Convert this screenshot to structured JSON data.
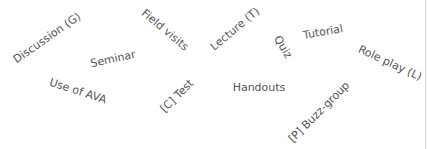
{
  "word_cloud": {
    "text_color": "#555555",
    "background": "#ffffff",
    "words": [
      {
        "text": "Discussion (G)",
        "x": 47,
        "y": 38,
        "rotate": -35,
        "size": 11
      },
      {
        "text": "Seminar",
        "x": 113,
        "y": 59,
        "rotate": -12,
        "size": 11
      },
      {
        "text": "Field visits",
        "x": 165,
        "y": 30,
        "rotate": 40,
        "size": 11
      },
      {
        "text": "Lecture (T)",
        "x": 235,
        "y": 29,
        "rotate": -40,
        "size": 11
      },
      {
        "text": "Quiz",
        "x": 283,
        "y": 47,
        "rotate": 60,
        "size": 11
      },
      {
        "text": "Tutorial",
        "x": 323,
        "y": 32,
        "rotate": -10,
        "size": 11
      },
      {
        "text": "Role play (L)",
        "x": 390,
        "y": 63,
        "rotate": 25,
        "size": 11
      },
      {
        "text": "Use of AVA",
        "x": 78,
        "y": 91,
        "rotate": 18,
        "size": 11
      },
      {
        "text": "[C] Test",
        "x": 177,
        "y": 96,
        "rotate": -45,
        "size": 11
      },
      {
        "text": "Handouts",
        "x": 259,
        "y": 87,
        "rotate": 0,
        "size": 11
      },
      {
        "text": "[P] Buzz-group",
        "x": 319,
        "y": 112,
        "rotate": -45,
        "size": 11
      }
    ]
  }
}
